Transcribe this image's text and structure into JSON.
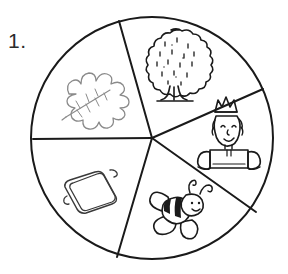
{
  "worksheet": {
    "item_number": "1.",
    "figure_type": "spinner-wheel",
    "description": "Circle divided into five segments, each containing a black-and-white line drawing"
  },
  "spinner": {
    "center": {
      "x": 152,
      "y": 138
    },
    "radius": 121,
    "outline_color": "#1a1a1a",
    "fill_color": "#ffffff",
    "divider_color": "#1a1a1a",
    "segment_count": 5,
    "dividers_degrees": [
      261,
      318,
      24,
      92,
      180
    ],
    "segments": [
      {
        "id": "segment-tree",
        "picture_name": "tree-drawing",
        "picture_label": "tree",
        "position": "top",
        "ink_color": "#1a1a1a"
      },
      {
        "id": "segment-king",
        "picture_name": "king-drawing",
        "picture_label": "king with crown",
        "position": "right",
        "ink_color": "#1a1a1a"
      },
      {
        "id": "segment-bee",
        "picture_name": "bee-drawing",
        "picture_label": "bee",
        "position": "bottom-right",
        "ink_color": "#1a1a1a"
      },
      {
        "id": "segment-tray",
        "picture_name": "tray-drawing",
        "picture_label": "tray",
        "position": "bottom-left",
        "ink_color": "#3a3a3a"
      },
      {
        "id": "segment-leaf",
        "picture_name": "leaf-drawing",
        "picture_label": "leaf",
        "position": "top-left",
        "ink_color": "#8a8a8a"
      }
    ]
  }
}
